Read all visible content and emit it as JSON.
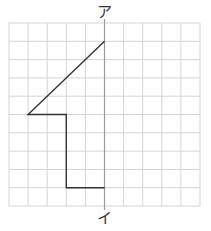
{
  "diagram": {
    "type": "grid-symmetry-figure",
    "grid": {
      "cols": 10,
      "rows": 10,
      "left": 9,
      "top": 23,
      "cell_w": 19.1,
      "cell_h": 18.3,
      "line_color": "#d4d4d4"
    },
    "axis": {
      "col": 5,
      "color": "#9a9a9a",
      "top_label": "ア",
      "bottom_label": "イ"
    },
    "figure": {
      "color": "#333333",
      "points": [
        [
          5,
          1
        ],
        [
          1,
          5
        ],
        [
          3,
          5
        ],
        [
          3,
          9
        ],
        [
          5,
          9
        ]
      ]
    }
  }
}
